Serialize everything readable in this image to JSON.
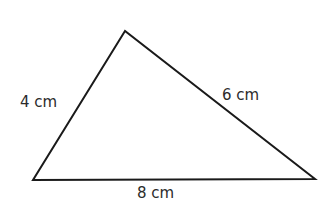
{
  "diagram": {
    "type": "triangle",
    "stroke_color": "#1a1a1a",
    "stroke_width": 2,
    "vertices": {
      "apex": {
        "x": 125,
        "y": 31
      },
      "bottom_left": {
        "x": 33,
        "y": 180
      },
      "bottom_right": {
        "x": 315,
        "y": 179
      }
    },
    "labels": {
      "left_side": {
        "text": "4 cm",
        "x": 20,
        "y": 107
      },
      "right_side": {
        "text": "6 cm",
        "x": 222,
        "y": 100
      },
      "bottom_side": {
        "text": "8 cm",
        "x": 137,
        "y": 198
      }
    }
  }
}
